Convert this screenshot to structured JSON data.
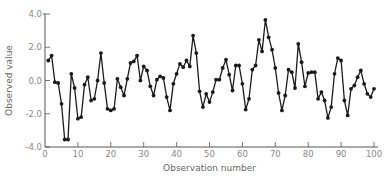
{
  "chart_data": {
    "type": "line",
    "title": "",
    "xlabel": "Observation number",
    "ylabel": "Observed value",
    "xlim": [
      0,
      100
    ],
    "ylim": [
      -4.0,
      4.0
    ],
    "x_ticks": [
      0,
      10,
      20,
      30,
      40,
      50,
      60,
      70,
      80,
      90,
      100
    ],
    "x_tick_labels": [
      "0",
      "10",
      "20",
      "30",
      "40",
      "50",
      "60",
      "70",
      "80",
      "90",
      "100"
    ],
    "y_ticks": [
      4.0,
      2.0,
      0.0,
      -2.0,
      -4.0
    ],
    "y_tick_labels": [
      "4.0",
      "2.0",
      "0.0",
      "-2.0",
      "-4.0"
    ],
    "grid": false,
    "legend": null,
    "markers": true,
    "series": [
      {
        "name": "Observed value",
        "color": "#1a1a1a",
        "x": [
          1,
          2,
          3,
          4,
          5,
          6,
          7,
          8,
          9,
          10,
          11,
          12,
          13,
          14,
          15,
          16,
          17,
          18,
          19,
          20,
          21,
          22,
          23,
          24,
          25,
          26,
          27,
          28,
          29,
          30,
          31,
          32,
          33,
          34,
          35,
          36,
          37,
          38,
          39,
          40,
          41,
          42,
          43,
          44,
          45,
          46,
          47,
          48,
          49,
          50,
          51,
          52,
          53,
          54,
          55,
          56,
          57,
          58,
          59,
          60,
          61,
          62,
          63,
          64,
          65,
          66,
          67,
          68,
          69,
          70,
          71,
          72,
          73,
          74,
          75,
          76,
          77,
          78,
          79,
          80,
          81,
          82,
          83,
          84,
          85,
          86,
          87,
          88,
          89,
          90,
          91,
          92,
          93,
          94,
          95,
          96,
          97,
          98,
          99,
          100
        ],
        "values": [
          1.2,
          1.5,
          -0.1,
          -0.15,
          -1.4,
          -3.55,
          -3.55,
          0.4,
          -0.45,
          -2.3,
          -2.2,
          -0.25,
          0.2,
          -1.2,
          -1.1,
          0.0,
          1.65,
          -0.15,
          -1.7,
          -1.8,
          -1.7,
          0.1,
          -0.4,
          -0.9,
          0.1,
          1.05,
          1.15,
          1.5,
          0.0,
          0.85,
          0.6,
          -0.35,
          -0.9,
          0.05,
          0.25,
          0.15,
          -1.0,
          -1.8,
          -0.2,
          0.4,
          1.0,
          0.8,
          1.2,
          0.85,
          2.7,
          1.65,
          -0.65,
          -1.6,
          -0.8,
          -1.3,
          -0.7,
          0.05,
          0.05,
          0.75,
          1.25,
          0.35,
          -0.6,
          0.9,
          0.9,
          -0.2,
          -1.75,
          -1.1,
          0.65,
          0.9,
          2.45,
          1.75,
          3.65,
          2.6,
          1.85,
          0.75,
          -0.75,
          -1.8,
          -0.9,
          0.65,
          0.5,
          -0.45,
          2.2,
          1.1,
          -0.35,
          0.45,
          0.5,
          0.5,
          -1.1,
          -0.7,
          -1.2,
          -2.25,
          -1.6,
          0.4,
          1.35,
          1.2,
          -1.2,
          -2.1,
          -0.5,
          -0.3,
          0.2,
          0.6,
          -0.2,
          -0.8,
          -1.0,
          -0.5
        ]
      }
    ]
  }
}
